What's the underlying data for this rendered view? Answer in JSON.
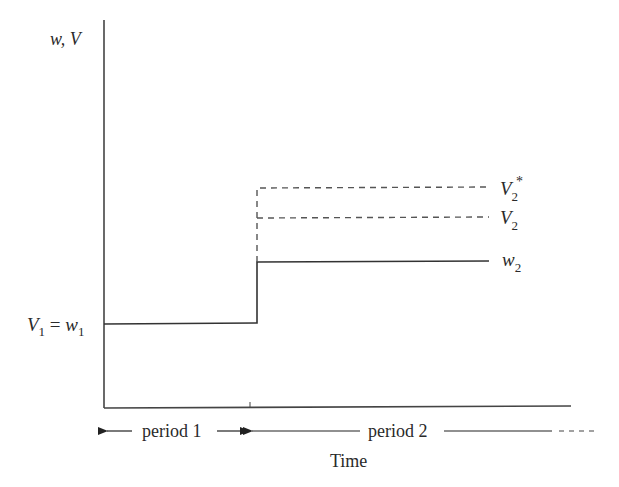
{
  "diagram": {
    "type": "step-diagram",
    "y_axis_label": "w, V",
    "x_axis_label": "Time",
    "colors": {
      "line": "#333333",
      "dashed": "#555555",
      "text": "#2a2a2a"
    },
    "series": [
      {
        "name": "w",
        "style": "solid",
        "period1_level": "w1",
        "period2_level": "w2"
      },
      {
        "name": "V2",
        "style": "dashed",
        "period2_level": "V2"
      },
      {
        "name": "V2*",
        "style": "dashed",
        "period2_level": "V2*"
      }
    ],
    "labels": {
      "v1_eq_w1": {
        "V": "V",
        "sub1": "1",
        "eq": " = ",
        "w": "w",
        "sub2": "1"
      },
      "v2_star": {
        "main": "V",
        "sub": "2",
        "sup": "*"
      },
      "v2": {
        "main": "V",
        "sub": "2"
      },
      "w2": {
        "main": "w",
        "sub": "2"
      }
    },
    "periods": [
      {
        "label": "period 1"
      },
      {
        "label": "period 2"
      }
    ]
  }
}
